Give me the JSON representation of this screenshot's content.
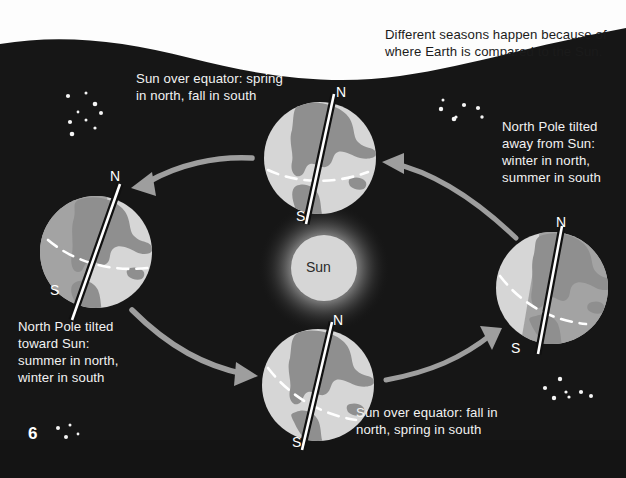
{
  "page": {
    "number": "6",
    "background_color": "#161616",
    "paper_color": "#fdfdfd"
  },
  "headline": {
    "text": "Different seasons happen because of\nwhere Earth is compared to the Sun."
  },
  "sun": {
    "label": "Sun",
    "color": "#d8d8d8",
    "glow_color": "#6e6e6e",
    "cx": 324,
    "cy": 268,
    "r": 33
  },
  "earths": [
    {
      "id": "earth-spring-north",
      "position": "top",
      "cx": 320,
      "cy": 158,
      "r": 56,
      "north_label": "N",
      "south_label": "S",
      "axis_tilt_deg": 12,
      "caption": "Sun over equator: spring\nin north, fall in south",
      "caption_x": 136,
      "caption_y": 70,
      "lit_side": "full"
    },
    {
      "id": "earth-summer-north",
      "position": "left",
      "cx": 96,
      "cy": 252,
      "r": 56,
      "north_label": "N",
      "south_label": "S",
      "axis_tilt_deg": 22,
      "caption": "North Pole tilted\ntoward Sun:\nsummer in north,\nwinter in south",
      "caption_x": 18,
      "caption_y": 318,
      "lit_side": "right"
    },
    {
      "id": "earth-fall-north",
      "position": "bottom",
      "cx": 318,
      "cy": 385,
      "r": 56,
      "north_label": "N",
      "south_label": "S",
      "axis_tilt_deg": 12,
      "caption": "Sun over equator: fall in\nnorth, spring in south",
      "caption_x": 356,
      "caption_y": 404,
      "lit_side": "full"
    },
    {
      "id": "earth-winter-north",
      "position": "right",
      "cx": 552,
      "cy": 288,
      "r": 56,
      "north_label": "N",
      "south_label": "S",
      "axis_tilt_deg": 10,
      "caption": "North Pole tilted\naway from Sun:\nwinter in north,\nsummer in south",
      "caption_x": 502,
      "caption_y": 118,
      "lit_side": "left"
    }
  ],
  "arrows": [
    {
      "id": "arrow-top-to-left",
      "direction": "left",
      "color": "#9e9e9e"
    },
    {
      "id": "arrow-right-to-top",
      "direction": "up-left",
      "color": "#9e9e9e"
    },
    {
      "id": "arrow-left-to-bottom",
      "direction": "down-right",
      "color": "#9e9e9e"
    },
    {
      "id": "arrow-bottom-to-right",
      "direction": "up-right",
      "color": "#9e9e9e"
    }
  ],
  "star_clusters": [
    {
      "id": "stars-upper-left",
      "count": 9
    },
    {
      "id": "stars-upper-right",
      "count": 7
    },
    {
      "id": "stars-lower-right",
      "count": 7
    },
    {
      "id": "stars-lower-left",
      "count": 4
    }
  ],
  "colors": {
    "night": "#161616",
    "earth_lit": "#d6d6d6",
    "earth_land": "#8f8f8f",
    "earth_shadow": "#8b8b8b",
    "equator": "#ffffff",
    "axis": "#101010",
    "text": "#f2f2f2",
    "arrow": "#9e9e9e"
  }
}
